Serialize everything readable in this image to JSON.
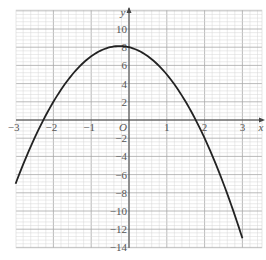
{
  "chart_data": {
    "type": "line",
    "title": "",
    "xlabel": "x",
    "ylabel": "y",
    "origin_label": "O",
    "xlim": [
      -3,
      3
    ],
    "ylim": [
      -14,
      12
    ],
    "grid": true,
    "x_ticks": [
      -3,
      -2,
      -1,
      1,
      2,
      3
    ],
    "x_tick_labels": [
      "−3",
      "−2",
      "−1",
      "1",
      "2",
      "3"
    ],
    "y_ticks": [
      10,
      8,
      6,
      4,
      2,
      -2,
      -4,
      -6,
      -8,
      -10,
      -12,
      -14
    ],
    "y_tick_labels": [
      "10",
      "8",
      "6",
      "4",
      "2",
      "−2",
      "−4",
      "−6",
      "−8",
      "−10",
      "−12",
      "−14"
    ],
    "series": [
      {
        "name": "y = 8 − x − 2x²",
        "color": "#222222",
        "x": [
          -3,
          -2.5,
          -2,
          -1.5,
          -1,
          -0.5,
          -0.25,
          0,
          0.5,
          1,
          1.5,
          2,
          2.5,
          3
        ],
        "y": [
          -7,
          -2,
          2,
          5,
          7,
          8,
          8.125,
          8,
          7,
          5,
          2,
          -2,
          -7,
          -13
        ]
      }
    ]
  },
  "colors": {
    "grid_minor": "#d6d6d6",
    "grid_major": "#a8a8a8",
    "axis": "#444444",
    "curve": "#222222"
  }
}
